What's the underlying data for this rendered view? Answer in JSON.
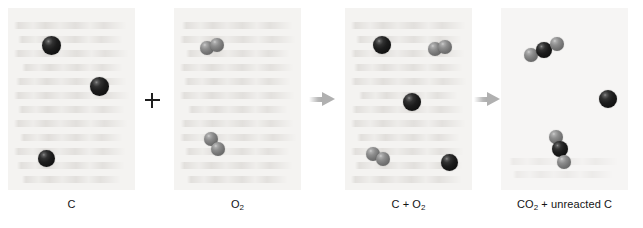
{
  "figure": {
    "type": "particulate-reaction-diagram",
    "background_color": "#ffffff",
    "panel_background_color": "#f4f3f1"
  },
  "legend": {
    "carbon_color": "#151515",
    "oxygen_color": "#7d7d7d",
    "arrow_color": "#b0b0b0",
    "plus_color": "#1f1f1f"
  },
  "operators": [
    {
      "name": "plus",
      "symbol": "+",
      "between": [
        "C",
        "O2"
      ]
    },
    {
      "name": "arrow-1",
      "symbol": "→",
      "between": [
        "O2",
        "C + O2"
      ]
    },
    {
      "name": "arrow-2",
      "symbol": "→",
      "between": [
        "C + O2",
        "CO2 + unreacted C"
      ]
    }
  ],
  "panels": [
    {
      "id": "reactant-carbon",
      "caption": "C",
      "caption_formula": {
        "main": "C",
        "sub": ""
      },
      "species": "carbon atoms",
      "counts": {
        "carbon_atoms": 3,
        "oxygen_molecules": 0
      },
      "molecules": [
        {
          "kind": "C",
          "atoms": [
            {
              "el": "C",
              "x": 34,
              "y": 28,
              "r": 19
            }
          ]
        },
        {
          "kind": "C",
          "atoms": [
            {
              "el": "C",
              "x": 82,
              "y": 69,
              "r": 19
            }
          ]
        },
        {
          "kind": "C",
          "atoms": [
            {
              "el": "C",
              "x": 30,
              "y": 142,
              "r": 17
            }
          ]
        }
      ]
    },
    {
      "id": "reactant-oxygen",
      "caption": "O2",
      "caption_formula": {
        "main": "O",
        "sub": "2"
      },
      "species": "oxygen molecules",
      "counts": {
        "carbon_atoms": 0,
        "oxygen_molecules": 2
      },
      "molecules": [
        {
          "kind": "O2",
          "rotation": -12,
          "atoms": [
            {
              "el": "O",
              "x": 26,
              "y": 33,
              "r": 14
            },
            {
              "el": "O",
              "x": 46,
              "y": 30,
              "r": 14
            }
          ]
        },
        {
          "kind": "O2",
          "rotation": 58,
          "atoms": [
            {
              "el": "O",
              "x": 30,
              "y": 124,
              "r": 14
            },
            {
              "el": "O",
              "x": 43,
              "y": 140,
              "r": 14
            }
          ]
        }
      ]
    },
    {
      "id": "mixture",
      "caption": "C + O2",
      "caption_formula": {
        "main": "C + O",
        "sub": "2"
      },
      "species": "carbon atoms and oxygen molecules",
      "counts": {
        "carbon_atoms": 3,
        "oxygen_molecules": 2
      },
      "molecules": [
        {
          "kind": "C",
          "atoms": [
            {
              "el": "C",
              "x": 28,
              "y": 28,
              "r": 18
            }
          ]
        },
        {
          "kind": "O2",
          "rotation": -8,
          "atoms": [
            {
              "el": "O",
              "x": 83,
              "y": 34,
              "r": 14
            },
            {
              "el": "O",
              "x": 102,
              "y": 32,
              "r": 14
            }
          ]
        },
        {
          "kind": "C",
          "atoms": [
            {
              "el": "C",
              "x": 58,
              "y": 85,
              "r": 18
            }
          ]
        },
        {
          "kind": "O2",
          "rotation": 28,
          "atoms": [
            {
              "el": "O",
              "x": 21,
              "y": 139,
              "r": 14
            },
            {
              "el": "O",
              "x": 39,
              "y": 147,
              "r": 14
            }
          ]
        },
        {
          "kind": "C",
          "atoms": [
            {
              "el": "C",
              "x": 96,
              "y": 146,
              "r": 17
            }
          ]
        }
      ]
    },
    {
      "id": "products",
      "caption": "CO2 + unreacted C",
      "caption_formula": {
        "main": "CO",
        "sub": "2",
        "tail": " + unreacted C"
      },
      "species": "carbon dioxide molecules and leftover carbon",
      "counts": {
        "co2_molecules": 2,
        "unreacted_carbon_atoms": 1
      },
      "molecules": [
        {
          "kind": "CO2",
          "rotation": -14,
          "atoms": [
            {
              "el": "O",
              "x": 23,
              "y": 40,
              "r": 14
            },
            {
              "el": "C",
              "x": 43,
              "y": 34,
              "r": 16
            },
            {
              "el": "O",
              "x": 63,
              "y": 29,
              "r": 14
            }
          ]
        },
        {
          "kind": "C",
          "atoms": [
            {
              "el": "C",
              "x": 98,
              "y": 82,
              "r": 18
            }
          ]
        },
        {
          "kind": "CO2",
          "rotation": 72,
          "atoms": [
            {
              "el": "O",
              "x": 48,
              "y": 122,
              "r": 14
            },
            {
              "el": "C",
              "x": 55,
              "y": 141,
              "r": 16
            },
            {
              "el": "O",
              "x": 62,
              "y": 160,
              "r": 14
            }
          ]
        }
      ]
    }
  ]
}
